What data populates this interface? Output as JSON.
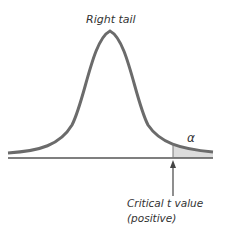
{
  "title": "Right tail",
  "tail_label": "α",
  "critical_label_line1": "Critical t value",
  "critical_label_line2": "(positive)",
  "colors": {
    "curve": "#6b6b6b",
    "axis": "#555555",
    "shade": "#dcdcdc",
    "text": "#333333"
  }
}
